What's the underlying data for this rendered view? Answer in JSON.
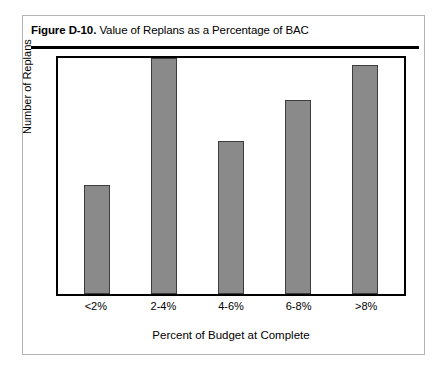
{
  "figure": {
    "number_label": "Figure D-10.",
    "caption": "Value of Replans as a Percentage of BAC"
  },
  "colors": {
    "bar_fill": "#8a8a8a",
    "bar_stroke": "#3d3d3d",
    "frame": "#000000",
    "card_border": "#b4b4b4",
    "rule": "#000000"
  },
  "chart_data": {
    "type": "bar",
    "title": "Value of Replans as a Percentage of BAC",
    "xlabel": "Percent of Budget at Complete",
    "ylabel": "Number of Replans",
    "categories": [
      "<2%",
      "2-4%",
      "4-6%",
      "6-8%",
      ">8%"
    ],
    "values": [
      46,
      100,
      65,
      82,
      97
    ],
    "value_unit": "relative height (percent of tallest bar)",
    "ylim": [
      0,
      100
    ],
    "y_ticks": [],
    "y_tick_labels": [],
    "grid": false,
    "legend": null,
    "annotations": []
  }
}
